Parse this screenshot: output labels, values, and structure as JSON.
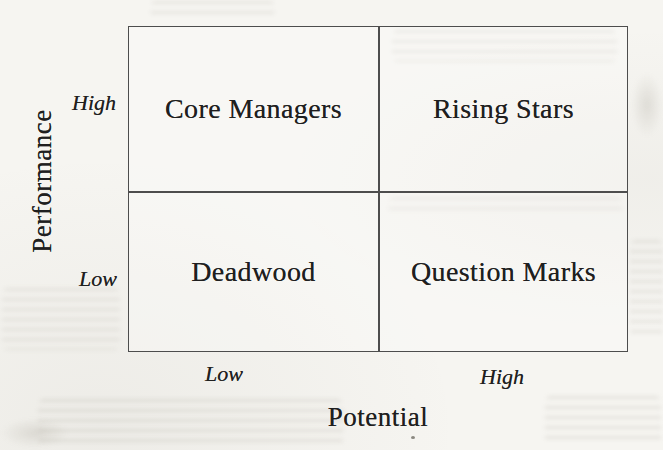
{
  "diagram": {
    "y_axis": {
      "title": "Performance",
      "ticks": [
        "High",
        "Low"
      ]
    },
    "x_axis": {
      "title": "Potential",
      "ticks": [
        "Low",
        "High"
      ]
    },
    "quadrants": [
      {
        "position": "top-left",
        "performance": "High",
        "potential": "Low",
        "label": "Core Managers"
      },
      {
        "position": "top-right",
        "performance": "High",
        "potential": "High",
        "label": "Rising Stars"
      },
      {
        "position": "bottom-left",
        "performance": "Low",
        "potential": "Low",
        "label": "Deadwood"
      },
      {
        "position": "bottom-right",
        "performance": "Low",
        "potential": "High",
        "label": "Question Marks"
      }
    ]
  },
  "colors": {
    "paper": "#f6f5f1",
    "ink": "#1f1f1f",
    "line": "#4d4d4d",
    "smudge": "#d8d5cc"
  }
}
